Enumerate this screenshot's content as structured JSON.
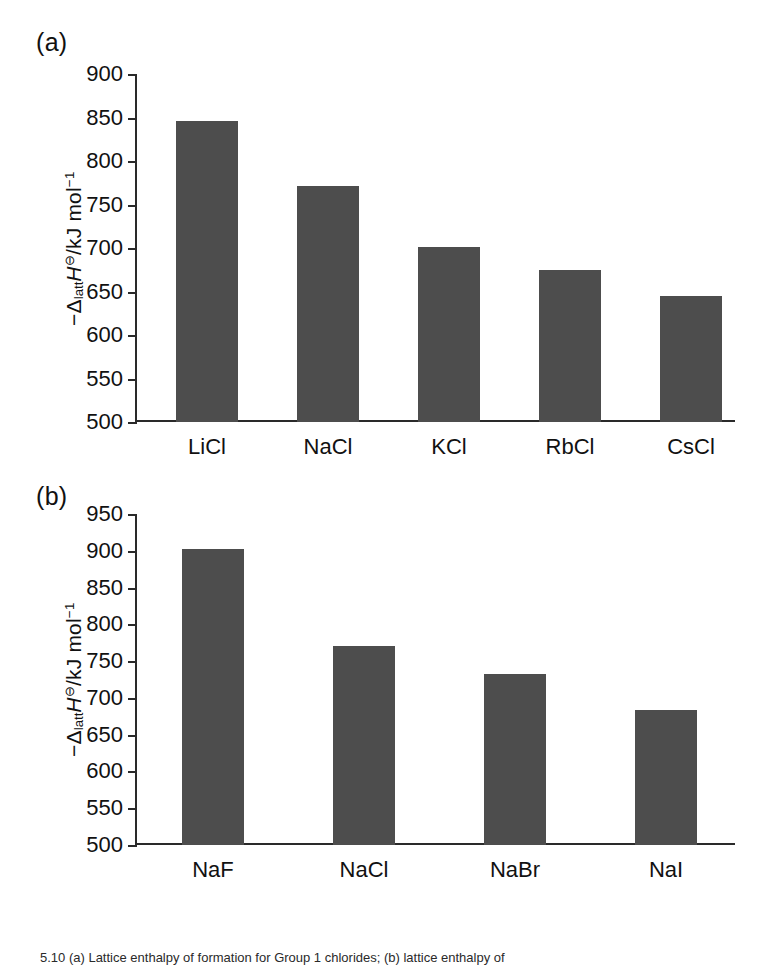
{
  "figure": {
    "caption": "5.10 (a) Lattice enthalpy of formation for Group 1 chlorides; (b) lattice enthalpy of"
  },
  "panels": [
    {
      "tag": "(a)",
      "ylabel_prefix": "−Δ",
      "ylabel_sub": "latt",
      "ylabel_H": "H",
      "ylabel_standard": "⊖",
      "ylabel_units": "/kJ mol",
      "ylabel_exp": "−1"
    },
    {
      "tag": "(b)",
      "ylabel_prefix": "−Δ",
      "ylabel_sub": "latt",
      "ylabel_H": "H",
      "ylabel_standard": "⊖",
      "ylabel_units": "/kJ mol",
      "ylabel_exp": "−1"
    }
  ],
  "chart_data": [
    {
      "type": "bar",
      "panel": "(a)",
      "title": "",
      "xlabel": "",
      "ylabel": "−Δlatt H⊖/kJ mol−1",
      "categories": [
        "LiCl",
        "NaCl",
        "KCl",
        "RbCl",
        "CsCl"
      ],
      "values": [
        846,
        771,
        701,
        675,
        645
      ],
      "ylim": [
        500,
        900
      ],
      "yticks": [
        500,
        550,
        600,
        650,
        700,
        750,
        800,
        850,
        900
      ],
      "grid": false,
      "legend": "none",
      "bar_color": "#4d4d4d"
    },
    {
      "type": "bar",
      "panel": "(b)",
      "title": "",
      "xlabel": "",
      "ylabel": "−Δlatt H⊖/kJ mol−1",
      "categories": [
        "NaF",
        "NaCl",
        "NaBr",
        "NaI"
      ],
      "values": [
        902,
        771,
        733,
        684
      ],
      "ylim": [
        500,
        950
      ],
      "yticks": [
        500,
        550,
        600,
        650,
        700,
        750,
        800,
        850,
        900,
        950
      ],
      "grid": false,
      "legend": "none",
      "bar_color": "#4d4d4d"
    }
  ]
}
